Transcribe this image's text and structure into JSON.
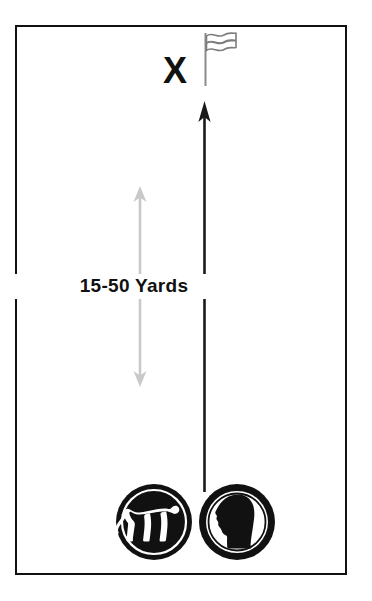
{
  "diagram": {
    "frame": {
      "name": "training-field-frame",
      "border_color": "#111111"
    },
    "markers": {
      "target_mark": "X",
      "target_mark_name": "x-target-marker",
      "flag_name": "flag-icon",
      "flag_color": "#6e6e6e"
    },
    "distance": {
      "label": "15-50 Yards",
      "arrow_name": "distance-measure-arrow",
      "arrow_color": "#c9c9c9",
      "arrow_top_y": 188,
      "arrow_bottom_y": 385
    },
    "path": {
      "name": "retrieve-path-arrow",
      "color": "#1a1a1a",
      "direction": "upward",
      "start_y": 492,
      "end_y": 104
    },
    "badges": [
      {
        "id": "dog-badge",
        "icon": "dog-icon",
        "style": "filled-circle-white-silhouette",
        "fill": "#111111",
        "silhouette": "#ffffff"
      },
      {
        "id": "handler-badge",
        "icon": "person-head-icon",
        "style": "ring-circle-black-silhouette",
        "fill": "#111111",
        "silhouette": "#111111"
      }
    ]
  }
}
